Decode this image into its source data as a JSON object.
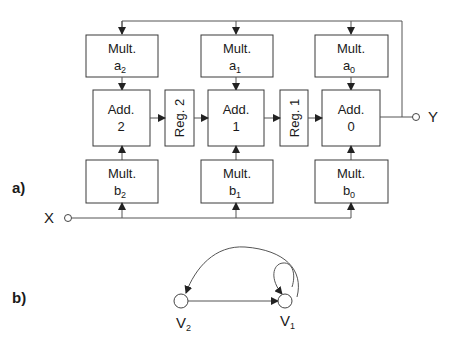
{
  "figure": {
    "part_a": {
      "label": "a)",
      "input_label": "X",
      "output_label": "Y",
      "mult_a": [
        {
          "title": "Mult.",
          "coef": "a",
          "sub": "2"
        },
        {
          "title": "Mult.",
          "coef": "a",
          "sub": "1"
        },
        {
          "title": "Mult.",
          "coef": "a",
          "sub": "0"
        }
      ],
      "adders": [
        {
          "title": "Add.",
          "index": "2"
        },
        {
          "title": "Add.",
          "index": "1"
        },
        {
          "title": "Add.",
          "index": "0"
        }
      ],
      "registers": [
        {
          "label": "Reg. 2"
        },
        {
          "label": "Reg. 1"
        }
      ],
      "mult_b": [
        {
          "title": "Mult.",
          "coef": "b",
          "sub": "2"
        },
        {
          "title": "Mult.",
          "coef": "b",
          "sub": "1"
        },
        {
          "title": "Mult.",
          "coef": "b",
          "sub": "0"
        }
      ]
    },
    "part_b": {
      "label": "b)",
      "nodes": [
        {
          "name": "V",
          "sub": "2"
        },
        {
          "name": "V",
          "sub": "1"
        }
      ],
      "edges": [
        {
          "from": "V2",
          "to": "V1"
        },
        {
          "from": "V1",
          "to": "V2"
        },
        {
          "from": "V1",
          "to": "V1"
        }
      ]
    }
  }
}
